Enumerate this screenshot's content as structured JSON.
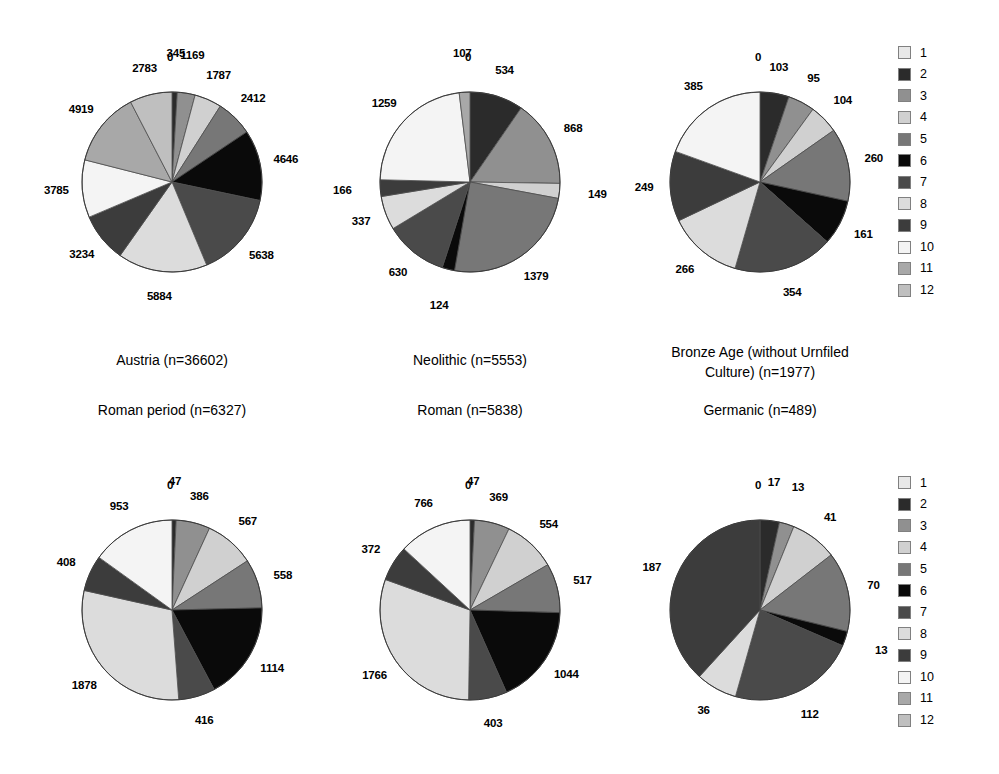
{
  "figure": {
    "background": "#ffffff",
    "width": 999,
    "height": 774
  },
  "legend": {
    "title": "",
    "position": "right",
    "entries": [
      {
        "label": "1",
        "color": "#e8e8e8"
      },
      {
        "label": "2",
        "color": "#2b2b2b"
      },
      {
        "label": "3",
        "color": "#909090"
      },
      {
        "label": "4",
        "color": "#d0d0d0"
      },
      {
        "label": "5",
        "color": "#777777"
      },
      {
        "label": "6",
        "color": "#0a0a0a"
      },
      {
        "label": "7",
        "color": "#4a4a4a"
      },
      {
        "label": "8",
        "color": "#dcdcdc"
      },
      {
        "label": "9",
        "color": "#3c3c3c"
      },
      {
        "label": "10",
        "color": "#f4f4f4"
      },
      {
        "label": "11",
        "color": "#a8a8a8"
      },
      {
        "label": "12",
        "color": "#bfbfbf"
      }
    ]
  },
  "chart_data": [
    {
      "type": "pie",
      "id": "austria",
      "title": "Austria (n=36602)",
      "categories": [
        "1",
        "2",
        "3",
        "4",
        "5",
        "6",
        "7",
        "8",
        "9",
        "10",
        "11",
        "12"
      ],
      "values": [
        0,
        345,
        1169,
        1787,
        2412,
        4646,
        5638,
        5884,
        3234,
        3785,
        4919,
        2783
      ],
      "labels": [
        "0",
        "345",
        "1169",
        "1787",
        "2412",
        "4646",
        "5638",
        "5884",
        "3234",
        "3785",
        "4919",
        "2783"
      ],
      "total": 36602
    },
    {
      "type": "pie",
      "id": "neolithic",
      "title": "Neolithic (n=5553)",
      "categories": [
        "1",
        "2",
        "3",
        "4",
        "5",
        "6",
        "7",
        "8",
        "9",
        "10",
        "11",
        "12"
      ],
      "values": [
        0,
        534,
        868,
        149,
        1379,
        124,
        630,
        337,
        166,
        1259,
        107,
        0
      ],
      "labels": [
        "0",
        "534",
        "868",
        "149",
        "1379",
        "124",
        "630",
        "337",
        "166",
        "1259",
        "107",
        ""
      ],
      "total": 5553
    },
    {
      "type": "pie",
      "id": "bronze-age",
      "title": "Bronze Age (without Urnfiled\nCulture) (n=1977)",
      "categories": [
        "1",
        "2",
        "3",
        "4",
        "5",
        "6",
        "7",
        "8",
        "9",
        "10",
        "11",
        "12"
      ],
      "values": [
        0,
        103,
        95,
        104,
        260,
        161,
        354,
        266,
        249,
        385,
        0,
        0
      ],
      "labels": [
        "0",
        "103",
        "95",
        "104",
        "260",
        "161",
        "354",
        "266",
        "249",
        "385",
        "",
        ""
      ],
      "total": 1977
    },
    {
      "type": "pie",
      "id": "roman-period",
      "title": "Roman period (n=6327)",
      "categories": [
        "1",
        "2",
        "3",
        "4",
        "5",
        "6",
        "7",
        "8",
        "9",
        "10",
        "11",
        "12"
      ],
      "values": [
        0,
        47,
        386,
        567,
        558,
        1114,
        416,
        1878,
        408,
        953,
        0,
        0
      ],
      "labels": [
        "0",
        "47",
        "386",
        "567",
        "558",
        "1114",
        "416",
        "1878",
        "408",
        "953",
        "",
        ""
      ],
      "total": 6327
    },
    {
      "type": "pie",
      "id": "roman",
      "title": "Roman (n=5838)",
      "categories": [
        "1",
        "2",
        "3",
        "4",
        "5",
        "6",
        "7",
        "8",
        "9",
        "10",
        "11",
        "12"
      ],
      "values": [
        0,
        47,
        369,
        554,
        517,
        1044,
        403,
        1766,
        372,
        766,
        0,
        0
      ],
      "labels": [
        "0",
        "47",
        "369",
        "554",
        "517",
        "1044",
        "403",
        "1766",
        "372",
        "766",
        "",
        ""
      ],
      "total": 5838
    },
    {
      "type": "pie",
      "id": "germanic",
      "title": "Germanic (n=489)",
      "categories": [
        "1",
        "2",
        "3",
        "4",
        "5",
        "6",
        "7",
        "8",
        "9",
        "10",
        "11",
        "12"
      ],
      "values": [
        0,
        17,
        13,
        41,
        70,
        13,
        112,
        36,
        187,
        0,
        0,
        0
      ],
      "labels": [
        "0",
        "17",
        "13",
        "41",
        "70",
        "13",
        "112",
        "36",
        "187",
        "",
        "",
        ""
      ],
      "total": 489
    }
  ],
  "layout": {
    "charts": [
      {
        "id": "austria",
        "cx": 172,
        "cy": 182,
        "r": 90,
        "caption_x": 172,
        "caption_y": 350
      },
      {
        "id": "neolithic",
        "cx": 470,
        "cy": 182,
        "r": 90,
        "caption_x": 470,
        "caption_y": 350
      },
      {
        "id": "bronze-age",
        "cx": 760,
        "cy": 182,
        "r": 90,
        "caption_x": 760,
        "caption_y": 342
      },
      {
        "id": "roman-period",
        "cx": 172,
        "cy": 610,
        "r": 90,
        "caption_x": 172,
        "caption_y": 400
      },
      {
        "id": "roman",
        "cx": 470,
        "cy": 610,
        "r": 90,
        "caption_x": 470,
        "caption_y": 400
      },
      {
        "id": "germanic",
        "cx": 760,
        "cy": 610,
        "r": 90,
        "caption_x": 760,
        "caption_y": 400
      }
    ],
    "legends": [
      {
        "x": 898,
        "y": 42
      },
      {
        "x": 898,
        "y": 472
      }
    ]
  }
}
